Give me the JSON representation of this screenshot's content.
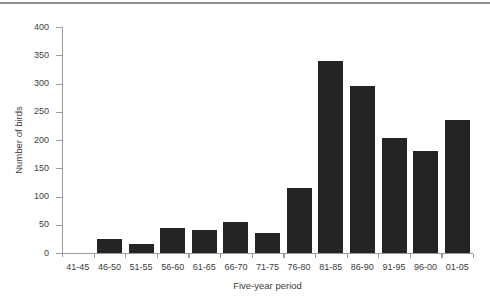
{
  "chart_data": {
    "type": "bar",
    "title": "",
    "categories": [
      "41-45",
      "46-50",
      "51-55",
      "56-60",
      "61-65",
      "66-70",
      "71-75",
      "76-80",
      "81-85",
      "86-90",
      "91-95",
      "96-00",
      "01-05"
    ],
    "values": [
      0,
      25,
      16,
      45,
      40,
      55,
      35,
      115,
      340,
      296,
      203,
      180,
      236
    ],
    "xlabel": "Five-year period",
    "ylabel": "Number of birds",
    "ylim": [
      0,
      400
    ],
    "yticks": [
      0,
      50,
      100,
      150,
      200,
      250,
      300,
      350,
      400
    ],
    "grid": false,
    "legend": "none",
    "bar_color": "#242424",
    "axis_color": "#9a9a9a",
    "text_color": "#3d3d3d",
    "background_color": "#ffffff",
    "top_rule_color": "#8f8f8f"
  }
}
